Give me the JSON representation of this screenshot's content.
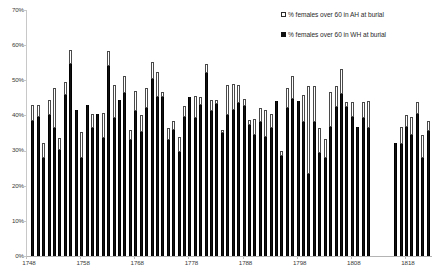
{
  "chart_data": {
    "type": "bar",
    "stacked": true,
    "title": "",
    "subtitle": "",
    "xlabel": "",
    "ylabel": "",
    "ylim": [
      0,
      70
    ],
    "ytick_labels": [
      "0%",
      "10%",
      "20%",
      "30%",
      "40%",
      "50%",
      "60%",
      "70%"
    ],
    "ytick_values": [
      0,
      10,
      20,
      30,
      40,
      50,
      60,
      70
    ],
    "xlim": [
      1748,
      1823
    ],
    "xtick_labels": [
      "1748",
      "1758",
      "1768",
      "1778",
      "1788",
      "1798",
      "1808",
      "1818"
    ],
    "xtick_values": [
      1748,
      1758,
      1768,
      1778,
      1788,
      1798,
      1808,
      1818
    ],
    "grid": false,
    "legend_position": "top-right",
    "legend": [
      {
        "name": "% females over 60 in AH at burial",
        "swatch": "hollow",
        "color": "#ffffff"
      },
      {
        "name": "% females over 60 in WH at burial",
        "swatch": "solid",
        "color": "#111111"
      }
    ],
    "series": [
      {
        "name": "% females over 60 in WH at burial",
        "key": "wh",
        "color": "#111111"
      },
      {
        "name": "% females over 60 in AH at burial",
        "key": "ah",
        "color": "#ffffff"
      }
    ],
    "categories": [
      1749,
      1750,
      1751,
      1752,
      1753,
      1754,
      1755,
      1756,
      1757,
      1758,
      1759,
      1760,
      1761,
      1762,
      1763,
      1764,
      1765,
      1766,
      1767,
      1768,
      1769,
      1770,
      1771,
      1772,
      1773,
      1774,
      1775,
      1776,
      1777,
      1778,
      1779,
      1780,
      1781,
      1782,
      1783,
      1784,
      1785,
      1786,
      1787,
      1788,
      1789,
      1790,
      1791,
      1792,
      1793,
      1794,
      1795,
      1796,
      1797,
      1798,
      1799,
      1800,
      1801,
      1802,
      1803,
      1804,
      1805,
      1806,
      1807,
      1808,
      1809,
      1810,
      1811,
      1816,
      1817,
      1818,
      1819,
      1820,
      1821,
      1822,
      1823
    ],
    "values_wh": [
      38.3,
      39.5,
      28.0,
      40.2,
      36.3,
      30.2,
      45.8,
      54.7,
      41.5,
      27.8,
      43.0,
      36.3,
      40.5,
      33.7,
      54.2,
      39.3,
      44.5,
      46.3,
      33.0,
      41.3,
      35.2,
      42.0,
      50.5,
      45.2,
      45.2,
      33.0,
      35.8,
      29.5,
      39.5,
      45.3,
      39.3,
      43.0,
      52.2,
      41.2,
      43.3,
      35.0,
      40.2,
      41.5,
      43.5,
      42.8,
      37.2,
      34.3,
      38.0,
      34.0,
      36.5,
      44.0,
      28.5,
      42.0,
      44.8,
      44.0,
      38.2,
      23.3,
      38.0,
      29.3,
      27.8,
      36.8,
      42.3,
      46.0,
      42.5,
      39.5,
      36.8,
      39.2,
      36.5,
      32.2,
      31.8,
      36.8,
      34.5,
      40.5,
      27.8,
      35.7
    ],
    "values_ah": [
      4.7,
      3.5,
      4.3,
      4.3,
      11.5,
      3.5,
      3.7,
      3.8,
      0.0,
      7.5,
      0.0,
      4.2,
      0.0,
      7.0,
      4.0,
      9.3,
      0.0,
      5.0,
      2.8,
      5.7,
      4.8,
      5.8,
      4.8,
      7.2,
      1.5,
      3.5,
      2.5,
      4.5,
      3.3,
      0.0,
      6.3,
      2.2,
      2.5,
      3.3,
      1.0,
      1.0,
      8.5,
      7.5,
      5.2,
      2.0,
      1.5,
      4.7,
      4.2,
      7.5,
      3.8,
      0.0,
      1.5,
      5.8,
      6.3,
      0.0,
      7.5,
      25.2,
      10.3,
      7.2,
      5.5,
      10.0,
      6.2,
      7.2,
      1.3,
      4.3,
      0.0,
      4.7,
      7.5,
      0.0,
      4.8,
      3.2,
      5.2,
      3.3,
      6.7,
      2.7
    ],
    "gap_years": [
      1812,
      1813,
      1814,
      1815
    ]
  },
  "legend": {
    "ah_label": "% females over 60 in AH at burial",
    "wh_label": "% females over 60 in WH at burial"
  }
}
